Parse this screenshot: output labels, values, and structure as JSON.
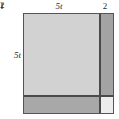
{
  "figure": {
    "kind": "area-model-square",
    "labels": {
      "top_left": "5t",
      "top_right": "2",
      "left_top": "5t",
      "left_bottom": "2"
    },
    "regions": [
      {
        "id": "a",
        "name": "large-square-region",
        "width_label": "5t",
        "height_label": "5t",
        "fill": "#d2d2d2"
      },
      {
        "id": "b",
        "name": "right-strip-region",
        "width_label": "2",
        "height_label": "5t",
        "fill": "#a3a3a3"
      },
      {
        "id": "c",
        "name": "bottom-strip-region",
        "width_label": "5t",
        "height_label": "2",
        "fill": "#a8a8a8"
      },
      {
        "id": "d",
        "name": "corner-square-region",
        "width_label": "2",
        "height_label": "2",
        "fill": "#ededed"
      }
    ],
    "colors": {
      "outline": "#555555",
      "divider": "#4a4a4a",
      "background": "#ffffff",
      "text": "#2b2b2b"
    }
  }
}
